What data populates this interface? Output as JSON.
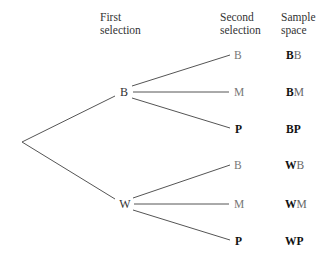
{
  "headers": {
    "first": [
      "First",
      "selection"
    ],
    "second": [
      "Second",
      "selection"
    ],
    "sample": [
      "Sample",
      "space"
    ]
  },
  "tree": {
    "first_level": [
      {
        "label": "B",
        "children": [
          {
            "label": "B",
            "bold": false,
            "outcome": [
              "B",
              "B"
            ]
          },
          {
            "label": "M",
            "bold": false,
            "outcome": [
              "B",
              "M"
            ]
          },
          {
            "label": "P",
            "bold": true,
            "outcome": [
              "B",
              "P"
            ]
          }
        ]
      },
      {
        "label": "W",
        "children": [
          {
            "label": "B",
            "bold": false,
            "outcome": [
              "W",
              "B"
            ]
          },
          {
            "label": "M",
            "bold": false,
            "outcome": [
              "W",
              "M"
            ]
          },
          {
            "label": "P",
            "bold": true,
            "outcome": [
              "W",
              "P"
            ]
          }
        ]
      }
    ]
  },
  "colors": {
    "line": "#555555",
    "text": "#333333"
  }
}
